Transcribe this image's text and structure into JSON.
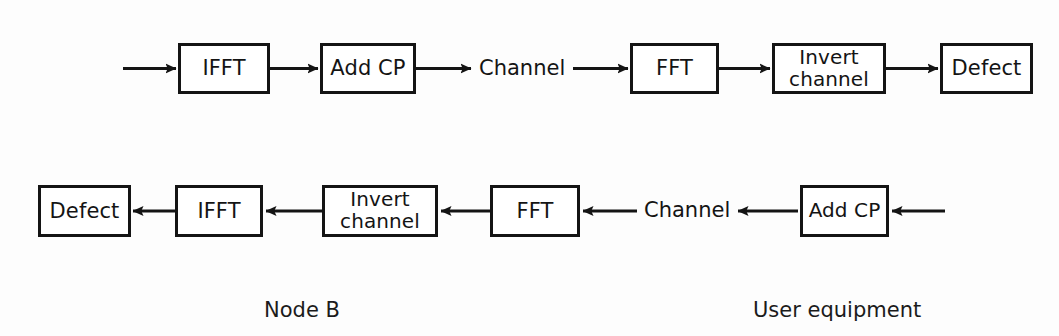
{
  "diagram": {
    "background_color": "#fdfdfd",
    "stroke_color": "#141414",
    "rows": [
      {
        "id": "downlink",
        "direction": "left-to-right",
        "blocks": [
          {
            "id": "dl-ifft",
            "label": "IFFT",
            "x": 178,
            "y": 43,
            "w": 92,
            "h": 51
          },
          {
            "id": "dl-addcp",
            "label": "Add CP",
            "x": 320,
            "y": 43,
            "w": 96,
            "h": 51
          },
          {
            "id": "dl-fft",
            "label": "FFT",
            "x": 630,
            "y": 43,
            "w": 89,
            "h": 51
          },
          {
            "id": "dl-invert",
            "label": "Invert\nchannel",
            "x": 772,
            "y": 43,
            "w": 114,
            "h": 51
          },
          {
            "id": "dl-defect",
            "label": "Defect",
            "x": 940,
            "y": 43,
            "w": 93,
            "h": 51
          }
        ],
        "free_text": [
          {
            "id": "dl-channel",
            "label": "Channel",
            "x": 479,
            "y": 57
          }
        ]
      },
      {
        "id": "uplink",
        "direction": "right-to-left",
        "blocks": [
          {
            "id": "ul-defect",
            "label": "Defect",
            "x": 38,
            "y": 185,
            "w": 93,
            "h": 52
          },
          {
            "id": "ul-ifft",
            "label": "IFFT",
            "x": 175,
            "y": 185,
            "w": 88,
            "h": 52
          },
          {
            "id": "ul-invert",
            "label": "Invert\nchannel",
            "x": 322,
            "y": 185,
            "w": 116,
            "h": 52
          },
          {
            "id": "ul-fft",
            "label": "FFT",
            "x": 490,
            "y": 185,
            "w": 90,
            "h": 52
          },
          {
            "id": "ul-addcp",
            "label": "Add CP",
            "x": 800,
            "y": 185,
            "w": 89,
            "h": 52
          }
        ],
        "free_text": [
          {
            "id": "ul-channel",
            "label": "Channel",
            "x": 644,
            "y": 199
          }
        ]
      }
    ],
    "section_labels": [
      {
        "id": "label-node-b",
        "label": "Node B",
        "x": 264,
        "y": 298
      },
      {
        "id": "label-user-equipment",
        "label": "User equipment",
        "x": 753,
        "y": 298
      }
    ]
  }
}
